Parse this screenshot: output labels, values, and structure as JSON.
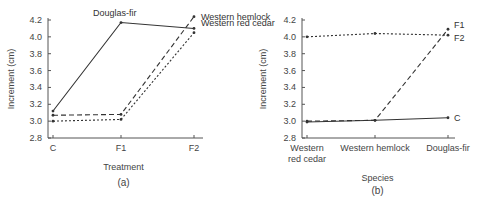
{
  "chart_data": [
    {
      "type": "line",
      "panel": "(a)",
      "title": "",
      "xlabel": "Treatment",
      "ylabel": "Increment (cm)",
      "categories": [
        "C",
        "F1",
        "F2"
      ],
      "ylim": [
        2.8,
        4.2
      ],
      "yticks": [
        2.8,
        3.0,
        3.2,
        3.4,
        3.6,
        3.8,
        4.0,
        4.2
      ],
      "grid": false,
      "legend": "inline labels at line ends",
      "series": [
        {
          "name": "Douglas-fir",
          "style": "solid",
          "values": [
            3.12,
            4.17,
            4.1
          ],
          "label_position": "top-at-F1"
        },
        {
          "name": "Western hemlock",
          "style": "dashed",
          "values": [
            3.07,
            3.08,
            4.24
          ],
          "label_position": "right-at-F2"
        },
        {
          "name": "Western red cedar",
          "style": "dotted",
          "values": [
            3.0,
            3.02,
            4.05
          ],
          "label_position": "right-at-F2"
        }
      ]
    },
    {
      "type": "line",
      "panel": "(b)",
      "title": "",
      "xlabel": "Species",
      "ylabel": "Increment (cm)",
      "categories": [
        "Western red cedar",
        "Western hemlock",
        "Douglas-fir"
      ],
      "category_lines": [
        [
          "Western",
          "red cedar"
        ],
        [
          "Western hemlock"
        ],
        [
          "Douglas-fir"
        ]
      ],
      "ylim": [
        2.8,
        4.2
      ],
      "yticks": [
        2.8,
        3.0,
        3.2,
        3.4,
        3.6,
        3.8,
        4.0,
        4.2
      ],
      "grid": false,
      "legend": "inline labels at line ends",
      "series": [
        {
          "name": "F1",
          "style": "dashed",
          "values": [
            3.0,
            3.01,
            4.09
          ]
        },
        {
          "name": "F2",
          "style": "dotted",
          "values": [
            4.0,
            4.04,
            4.02
          ]
        },
        {
          "name": "C",
          "style": "solid",
          "values": [
            2.99,
            3.01,
            3.04
          ]
        }
      ]
    }
  ],
  "colors": {
    "line": "#333333",
    "axis": "#555555",
    "text": "#444444"
  }
}
